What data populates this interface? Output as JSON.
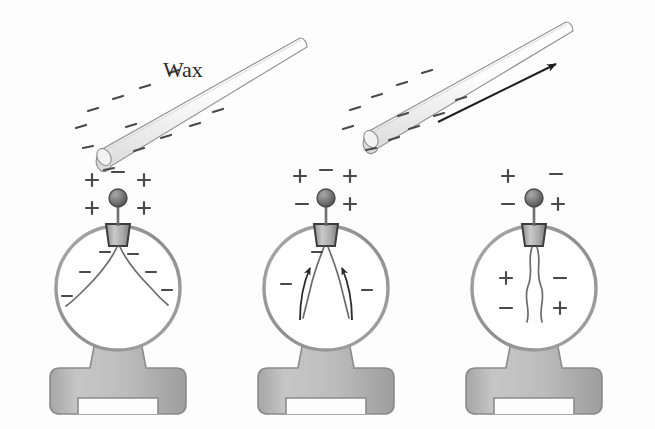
{
  "figure": {
    "background_color": "#fdfdfd",
    "ink_color": "#4a4a4a",
    "metal_color": "#b3b3b3",
    "glass_outline_color": "#9a9a9a",
    "arrow_color": "#1f1f1f"
  },
  "labels": {
    "wax": "Wax"
  },
  "rods": [
    {
      "name": "wax-rod-near",
      "label": "Wax",
      "charge_symbol": "-",
      "charge_count": 12,
      "angle_deg": -22,
      "x1": 95,
      "y1": 150,
      "x2": 300,
      "y2": 40,
      "caption": "Negatively charged wax rod held near the electroscope knob"
    },
    {
      "name": "wax-rod-withdrawn",
      "label": "",
      "charge_symbol": "-",
      "charge_count": 11,
      "angle_deg": -22,
      "x1": 362,
      "y1": 130,
      "x2": 570,
      "y2": 25,
      "caption": "Wax rod being withdrawn, arrow shows direction of motion"
    }
  ],
  "motion_arrow": {
    "name": "rod-motion-arrow",
    "direction": "up-right",
    "x1": 438,
    "y1": 120,
    "x2": 560,
    "y2": 62
  },
  "electroscopes": [
    {
      "name": "electroscope-1",
      "index": 1,
      "center_x": 118,
      "state": "leaves-diverged",
      "caption": "Rod held near: knob becomes positive, leaves become negative and repel, diverging widely",
      "knob_signs": [
        {
          "symbol": "+",
          "dx": -22,
          "dy": -46
        },
        {
          "symbol": "-",
          "dx": 0,
          "dy": -62
        },
        {
          "symbol": "+",
          "dx": 22,
          "dy": -46
        },
        {
          "symbol": "+",
          "dx": -22,
          "dy": -26
        },
        {
          "symbol": "+",
          "dx": 22,
          "dy": -26
        }
      ],
      "bulb_signs": [
        {
          "symbol": "-",
          "dx": -12,
          "dy": -6
        },
        {
          "symbol": "-",
          "dx": 14,
          "dy": -4
        },
        {
          "symbol": "-",
          "dx": -32,
          "dy": 20
        },
        {
          "symbol": "-",
          "dx": 32,
          "dy": 20
        },
        {
          "symbol": "-",
          "dx": -48,
          "dy": 44
        },
        {
          "symbol": "-",
          "dx": 48,
          "dy": 40
        }
      ],
      "leaves": "diverged"
    },
    {
      "name": "electroscope-2",
      "index": 2,
      "center_x": 326,
      "state": "leaves-collapsing",
      "caption": "Rod withdrawn: charge redistributes, leaves collapse inward as shown by arrows",
      "knob_signs": [
        {
          "symbol": "+",
          "dx": -24,
          "dy": -50
        },
        {
          "symbol": "-",
          "dx": 0,
          "dy": -56
        },
        {
          "symbol": "+",
          "dx": 22,
          "dy": -50
        },
        {
          "symbol": "-",
          "dx": -22,
          "dy": -28
        },
        {
          "symbol": "+",
          "dx": 22,
          "dy": -28
        }
      ],
      "bulb_signs": [
        {
          "symbol": "-",
          "dx": -9,
          "dy": -4
        },
        {
          "symbol": "-",
          "dx": -40,
          "dy": 26
        },
        {
          "symbol": "-",
          "dx": 40,
          "dy": 32
        }
      ],
      "leaves": "collapsing",
      "leaf_arrows": 2
    },
    {
      "name": "electroscope-3",
      "index": 3,
      "center_x": 534,
      "state": "leaves-closed",
      "caption": "Rod removed: electroscope is neutral again, leaves hang closed together",
      "knob_signs": [
        {
          "symbol": "+",
          "dx": -22,
          "dy": -50
        },
        {
          "symbol": "-",
          "dx": 20,
          "dy": -52
        },
        {
          "symbol": "-",
          "dx": -22,
          "dy": -28
        },
        {
          "symbol": "+",
          "dx": 24,
          "dy": -28
        }
      ],
      "bulb_signs": [
        {
          "symbol": "+",
          "dx": -26,
          "dy": 18
        },
        {
          "symbol": "-",
          "dx": 24,
          "dy": 18
        },
        {
          "symbol": "-",
          "dx": -26,
          "dy": 48
        },
        {
          "symbol": "+",
          "dx": 26,
          "dy": 48
        }
      ],
      "leaves": "closed"
    }
  ]
}
